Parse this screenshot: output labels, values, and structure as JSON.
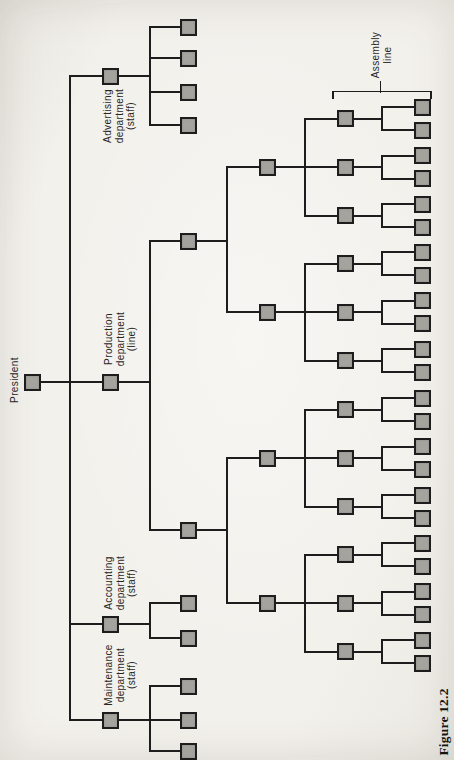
{
  "page": {
    "caption": "Figure 12.2"
  },
  "labels": {
    "president": "President",
    "advertising": [
      "Advertising",
      "department",
      "(staff)"
    ],
    "production": [
      "Production",
      "department",
      "(line)"
    ],
    "accounting": [
      "Accounting",
      "department",
      "(staff)"
    ],
    "maintenance": [
      "Maintenance",
      "department",
      "(staff)"
    ],
    "assembly": [
      "Assembly",
      "line"
    ]
  },
  "colors": {
    "box_fill": "#a5a39e",
    "line_color": "#1d1d1d",
    "paper": "#f3f1ec"
  },
  "diagram": {
    "box_size": 17,
    "tree": {
      "n": "president-box",
      "x": 32,
      "y": 382,
      "sx": 70,
      "c": [
        {
          "n": "advertising-department-box",
          "x": 110,
          "y": 76,
          "sx": 150,
          "c": [
            {
              "n": "advertising-staff-box",
              "x": 188,
              "y": 27
            },
            {
              "n": "advertising-staff-box",
              "x": 188,
              "y": 58
            },
            {
              "n": "advertising-staff-box",
              "x": 188,
              "y": 92
            },
            {
              "n": "advertising-staff-box",
              "x": 188,
              "y": 125
            }
          ]
        },
        {
          "n": "production-department-box",
          "x": 110,
          "y": 382,
          "sx": 150,
          "c": [
            {
              "n": "production-unit-box",
              "x": 188,
              "y": 241,
              "sx": 227,
              "c": [
                {
                  "n": "production-unit-box",
                  "x": 267,
                  "y": 167,
                  "sx": 305,
                  "c": [
                    {
                      "n": "foreman-box",
                      "x": 345,
                      "y": 118.5,
                      "sx": 382,
                      "c": [
                        {
                          "n": "assembly-worker-box",
                          "x": 422,
                          "y": 107
                        },
                        {
                          "n": "assembly-worker-box",
                          "x": 422,
                          "y": 130
                        }
                      ]
                    },
                    {
                      "n": "foreman-box",
                      "x": 345,
                      "y": 167,
                      "sx": 382,
                      "c": [
                        {
                          "n": "assembly-worker-box",
                          "x": 422,
                          "y": 155.5
                        },
                        {
                          "n": "assembly-worker-box",
                          "x": 422,
                          "y": 178.5
                        }
                      ]
                    },
                    {
                      "n": "foreman-box",
                      "x": 345,
                      "y": 215.5,
                      "sx": 382,
                      "c": [
                        {
                          "n": "assembly-worker-box",
                          "x": 422,
                          "y": 204
                        },
                        {
                          "n": "assembly-worker-box",
                          "x": 422,
                          "y": 227
                        }
                      ]
                    }
                  ]
                },
                {
                  "n": "production-unit-box",
                  "x": 267,
                  "y": 312,
                  "sx": 305,
                  "c": [
                    {
                      "n": "foreman-box",
                      "x": 345,
                      "y": 263.5,
                      "sx": 382,
                      "c": [
                        {
                          "n": "assembly-worker-box",
                          "x": 422,
                          "y": 252
                        },
                        {
                          "n": "assembly-worker-box",
                          "x": 422,
                          "y": 275
                        }
                      ]
                    },
                    {
                      "n": "foreman-box",
                      "x": 345,
                      "y": 312,
                      "sx": 382,
                      "c": [
                        {
                          "n": "assembly-worker-box",
                          "x": 422,
                          "y": 300.5
                        },
                        {
                          "n": "assembly-worker-box",
                          "x": 422,
                          "y": 323.5
                        }
                      ]
                    },
                    {
                      "n": "foreman-box",
                      "x": 345,
                      "y": 360.5,
                      "sx": 382,
                      "c": [
                        {
                          "n": "assembly-worker-box",
                          "x": 422,
                          "y": 349
                        },
                        {
                          "n": "assembly-worker-box",
                          "x": 422,
                          "y": 372
                        }
                      ]
                    }
                  ]
                }
              ]
            },
            {
              "n": "production-unit-box",
              "x": 188,
              "y": 530,
              "sx": 227,
              "c": [
                {
                  "n": "production-unit-box",
                  "x": 267,
                  "y": 458,
                  "sx": 305,
                  "c": [
                    {
                      "n": "foreman-box",
                      "x": 345,
                      "y": 409.5,
                      "sx": 382,
                      "c": [
                        {
                          "n": "assembly-worker-box",
                          "x": 422,
                          "y": 398
                        },
                        {
                          "n": "assembly-worker-box",
                          "x": 422,
                          "y": 421
                        }
                      ]
                    },
                    {
                      "n": "foreman-box",
                      "x": 345,
                      "y": 458,
                      "sx": 382,
                      "c": [
                        {
                          "n": "assembly-worker-box",
                          "x": 422,
                          "y": 446.5
                        },
                        {
                          "n": "assembly-worker-box",
                          "x": 422,
                          "y": 469.5
                        }
                      ]
                    },
                    {
                      "n": "foreman-box",
                      "x": 345,
                      "y": 506.5,
                      "sx": 382,
                      "c": [
                        {
                          "n": "assembly-worker-box",
                          "x": 422,
                          "y": 495
                        },
                        {
                          "n": "assembly-worker-box",
                          "x": 422,
                          "y": 518
                        }
                      ]
                    }
                  ]
                },
                {
                  "n": "production-unit-box",
                  "x": 267,
                  "y": 603,
                  "sx": 305,
                  "c": [
                    {
                      "n": "foreman-box",
                      "x": 345,
                      "y": 554.5,
                      "sx": 382,
                      "c": [
                        {
                          "n": "assembly-worker-box",
                          "x": 422,
                          "y": 543
                        },
                        {
                          "n": "assembly-worker-box",
                          "x": 422,
                          "y": 566
                        }
                      ]
                    },
                    {
                      "n": "foreman-box",
                      "x": 345,
                      "y": 603,
                      "sx": 382,
                      "c": [
                        {
                          "n": "assembly-worker-box",
                          "x": 422,
                          "y": 591.5
                        },
                        {
                          "n": "assembly-worker-box",
                          "x": 422,
                          "y": 614.5
                        }
                      ]
                    },
                    {
                      "n": "foreman-box",
                      "x": 345,
                      "y": 651.5,
                      "sx": 382,
                      "c": [
                        {
                          "n": "assembly-worker-box",
                          "x": 422,
                          "y": 640
                        },
                        {
                          "n": "assembly-worker-box",
                          "x": 422,
                          "y": 663
                        }
                      ]
                    }
                  ]
                }
              ]
            }
          ]
        },
        {
          "n": "accounting-department-box",
          "x": 110,
          "y": 624,
          "sx": 150,
          "c": [
            {
              "n": "accounting-staff-box",
              "x": 188,
              "y": 603
            },
            {
              "n": "accounting-staff-box",
              "x": 188,
              "y": 638
            }
          ]
        },
        {
          "n": "maintenance-department-box",
          "x": 110,
          "y": 720,
          "sx": 150,
          "c": [
            {
              "n": "maintenance-staff-box",
              "x": 188,
              "y": 686
            },
            {
              "n": "maintenance-staff-box",
              "x": 188,
              "y": 720
            },
            {
              "n": "maintenance-staff-box",
              "x": 188,
              "y": 751
            }
          ]
        }
      ]
    },
    "assembly_bracket": {
      "x1": 333,
      "x2": 431,
      "y": 91.5,
      "tick_len": 6,
      "label_tick_x": 380.5,
      "label_tick_y1": 82
    }
  }
}
